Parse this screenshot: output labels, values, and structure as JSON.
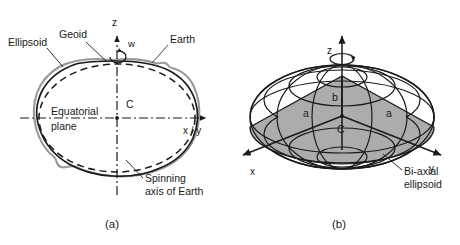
{
  "figure": {
    "background_color": "#ffffff",
    "ink_color": "#1a1a1a",
    "earth_curve_color": "#999999",
    "wedge_fill_color": "#a8a8a8",
    "panels": [
      {
        "id": "a",
        "caption": "(a)",
        "title_role": "cross-section of Earth, geoid and ellipsoid",
        "axes": {
          "vertical_label": "z",
          "horizontal_label": "x / y",
          "center_label": "C",
          "rotation_symbol": "w"
        },
        "labels": {
          "ellipsoid": "Ellipsoid",
          "geoid": "Geoid",
          "earth": "Earth",
          "equatorial_plane_line1": "Equatorial",
          "equatorial_plane_line2": "plane",
          "spinning_axis_line1": "Spinning",
          "spinning_axis_line2": "axis of Earth"
        }
      },
      {
        "id": "b",
        "caption": "(b)",
        "title_role": "bi-axial ellipsoid of revolution",
        "axes": {
          "vertical_label": "z",
          "horizontal_label_left": "x",
          "horizontal_label_right": "y",
          "center_label": "C"
        },
        "labels": {
          "semi_minor_axis": "b",
          "semi_major_axis_left": "a",
          "semi_major_axis_right": "a",
          "ellipsoid_name_line1": "Bi-axial",
          "ellipsoid_name_line2": "ellipsoid"
        }
      }
    ]
  }
}
